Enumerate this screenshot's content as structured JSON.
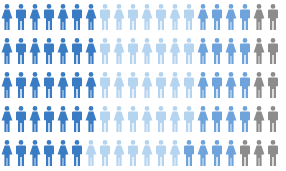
{
  "chart_data": {
    "type": "pictograph",
    "title": "",
    "icon_unit": "person",
    "icons_per_row": 20,
    "rows": 5,
    "total_icons": 100,
    "categories": [
      "Dark blue",
      "Light blue",
      "Medium blue",
      "Gray"
    ],
    "colors": {
      "Dark blue": "#3a7cc4",
      "Light blue": "#b5d4f0",
      "Medium blue": "#6ea3dc",
      "Gray": "#8c8c8c"
    },
    "values": [
      34,
      35,
      20,
      11
    ],
    "row_breakdown": [
      {
        "row": 1,
        "dark_blue": 7,
        "light_blue": 7,
        "medium_blue": 4,
        "gray": 2
      },
      {
        "row": 2,
        "dark_blue": 7,
        "light_blue": 7,
        "medium_blue": 4,
        "gray": 2
      },
      {
        "row": 3,
        "dark_blue": 7,
        "light_blue": 7,
        "medium_blue": 4,
        "gray": 2
      },
      {
        "row": 4,
        "dark_blue": 7,
        "light_blue": 7,
        "medium_blue": 4,
        "gray": 2
      },
      {
        "row": 5,
        "dark_blue": 6,
        "light_blue": 7,
        "medium_blue": 4,
        "gray": 3
      }
    ],
    "icon_pattern": "alternating female / male figures",
    "legend": "none",
    "grid": false
  }
}
